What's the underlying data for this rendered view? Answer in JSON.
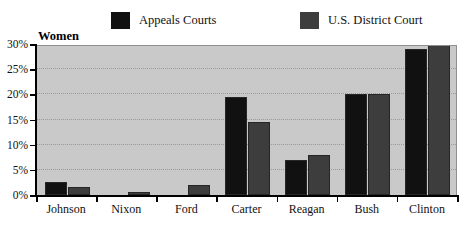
{
  "chart_data": {
    "type": "bar",
    "title": "Women",
    "xlabel": "",
    "ylabel": "",
    "ylim": [
      0,
      30
    ],
    "ytick_values": [
      0,
      5,
      10,
      15,
      20,
      25,
      30
    ],
    "ytick_labels": [
      "0%",
      "5%",
      "10%",
      "15%",
      "20%",
      "25%",
      "30%"
    ],
    "grid": true,
    "legend_position": "top",
    "categories": [
      "Johnson",
      "Nixon",
      "Ford",
      "Carter",
      "Reagan",
      "Bush",
      "Clinton"
    ],
    "series": [
      {
        "name": "Appeals Courts",
        "color": "#111111",
        "values": [
          2.5,
          0,
          0,
          19.5,
          7,
          20,
          29
        ]
      },
      {
        "name": "U.S. District Court",
        "color": "#3d3d3d",
        "values": [
          1.5,
          0.5,
          2,
          14.5,
          8,
          20,
          30
        ]
      }
    ]
  },
  "legend": {
    "entries": [
      {
        "label": "Appeals Courts",
        "color": "#111111"
      },
      {
        "label": "U.S. District Court",
        "color": "#3d3d3d"
      }
    ]
  },
  "colors": {
    "plot_background": "#c9c9c9",
    "plot_border": "#8e8e8e",
    "gridline": "#9a9a9a",
    "axis": "#000000",
    "appeals_courts": "#111111",
    "district_court": "#3d3d3d",
    "page_background": "#ffffff"
  }
}
